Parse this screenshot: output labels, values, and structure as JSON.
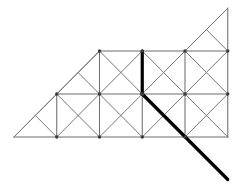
{
  "figure": {
    "canvas": {
      "width": 246,
      "height": 193,
      "background": "#ffffff"
    },
    "geometry": {
      "cell": 42.75,
      "origin_x": 14.0,
      "baseline_y": 137.0,
      "rows_y": [
        51.0,
        94.0,
        137.0
      ],
      "cols_x": [
        14.0,
        56.75,
        99.5,
        142.25,
        185.0,
        227.75
      ],
      "apex": {
        "x": 227.75,
        "y": 8.25
      }
    },
    "styles": {
      "thin_color": "#6d6d6d",
      "thin_width": 1.05,
      "bold_color": "#000000",
      "bold_width": 3.2,
      "node_color": "#3a3a3a"
    },
    "panels": [
      {
        "name": "row-bottom-col-1",
        "x": 56.75,
        "y": 94.0,
        "diagonals": "both"
      },
      {
        "name": "row-bottom-col-2",
        "x": 99.5,
        "y": 94.0,
        "diagonals": "both"
      },
      {
        "name": "row-bottom-col-3",
        "x": 142.25,
        "y": 94.0,
        "diagonals": "both"
      },
      {
        "name": "row-bottom-col-4",
        "x": 185.0,
        "y": 94.0,
        "diagonals": "both"
      },
      {
        "name": "row-middle-col-2",
        "x": 99.5,
        "y": 51.0,
        "diagonals": "both"
      },
      {
        "name": "row-middle-col-3",
        "x": 142.25,
        "y": 51.0,
        "diagonals": "both"
      },
      {
        "name": "row-middle-col-4",
        "x": 185.0,
        "y": 51.0,
        "diagonals": "both"
      }
    ],
    "half_panels": [
      {
        "name": "lower-left-corner-triangle",
        "vertices": "14,137 56.75,94 56.75,137"
      },
      {
        "name": "middle-left-triangle",
        "vertices": "56.75,94 99.5,51 99.5,94"
      },
      {
        "name": "apex-triangle",
        "vertices": "185,51 227.75,8.25 227.75,51"
      }
    ],
    "bold_members": [
      {
        "name": "bold-vertical-member",
        "x1": 142.25,
        "y1": 51.0,
        "x2": 142.25,
        "y2": 94.0
      },
      {
        "name": "bold-diagonal-member",
        "x1": 142.25,
        "y1": 94.0,
        "x2": 227.75,
        "y2": 179.5
      }
    ],
    "nodes": [
      {
        "x": 99.5,
        "y": 51.0
      },
      {
        "x": 142.25,
        "y": 51.0
      },
      {
        "x": 185.0,
        "y": 51.0
      },
      {
        "x": 227.75,
        "y": 51.0
      },
      {
        "x": 56.75,
        "y": 94.0
      },
      {
        "x": 99.5,
        "y": 94.0
      },
      {
        "x": 142.25,
        "y": 94.0
      },
      {
        "x": 185.0,
        "y": 94.0
      },
      {
        "x": 56.75,
        "y": 137.0
      },
      {
        "x": 99.5,
        "y": 137.0
      },
      {
        "x": 142.25,
        "y": 137.0
      },
      {
        "x": 185.0,
        "y": 137.0
      }
    ]
  }
}
